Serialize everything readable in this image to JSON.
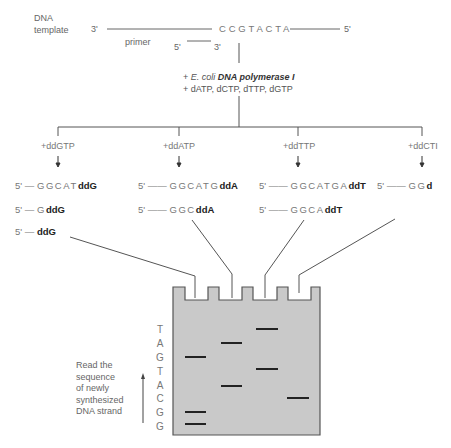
{
  "template": {
    "label_line1": "DNA",
    "label_line2": "template",
    "end_left": "3'",
    "sequence": "CCGTACTA",
    "end_right": "5'"
  },
  "primer": {
    "label": "primer",
    "end_left": "5'",
    "end_right": "3'"
  },
  "reagents": {
    "line1_prefix": "+ ",
    "line1_italic": "E. coli",
    "line1_bold": "DNA polymerase I",
    "line2": "+ dATP, dCTP, dTTP, dGTP"
  },
  "reactions": [
    {
      "label": "+ddGTP",
      "products": [
        {
          "prefix": "5' — ",
          "seq": "GGCAT",
          "term": "ddG"
        },
        {
          "prefix": "5' — ",
          "seq": "G",
          "term": "ddG"
        },
        {
          "prefix": "5' — ",
          "seq": "",
          "term": "ddG"
        }
      ]
    },
    {
      "label": "+ddATP",
      "products": [
        {
          "prefix": "5' —— ",
          "seq": "GGCATG",
          "term": "ddA"
        },
        {
          "prefix": "5' —— ",
          "seq": "GGC",
          "term": "ddA"
        }
      ]
    },
    {
      "label": "+ddTTP",
      "products": [
        {
          "prefix": "5' —— ",
          "seq": "GGCATGA",
          "term": "ddT"
        },
        {
          "prefix": "5' —— ",
          "seq": "GGCA",
          "term": "ddT"
        }
      ]
    },
    {
      "label": "+ddCTI",
      "products": [
        {
          "prefix": "5' —— ",
          "seq": "GG",
          "term": "d"
        }
      ]
    }
  ],
  "gel": {
    "fill": "#c9c9c9",
    "border": "#555555",
    "band_color": "#222222",
    "lanes": [
      "G",
      "A",
      "T",
      "C"
    ],
    "read_letters": [
      "T",
      "A",
      "G",
      "T",
      "A",
      "C",
      "G",
      "G"
    ],
    "read_label": [
      "Read the",
      "sequence",
      "of newly",
      "synthesized",
      "DNA strand"
    ]
  }
}
